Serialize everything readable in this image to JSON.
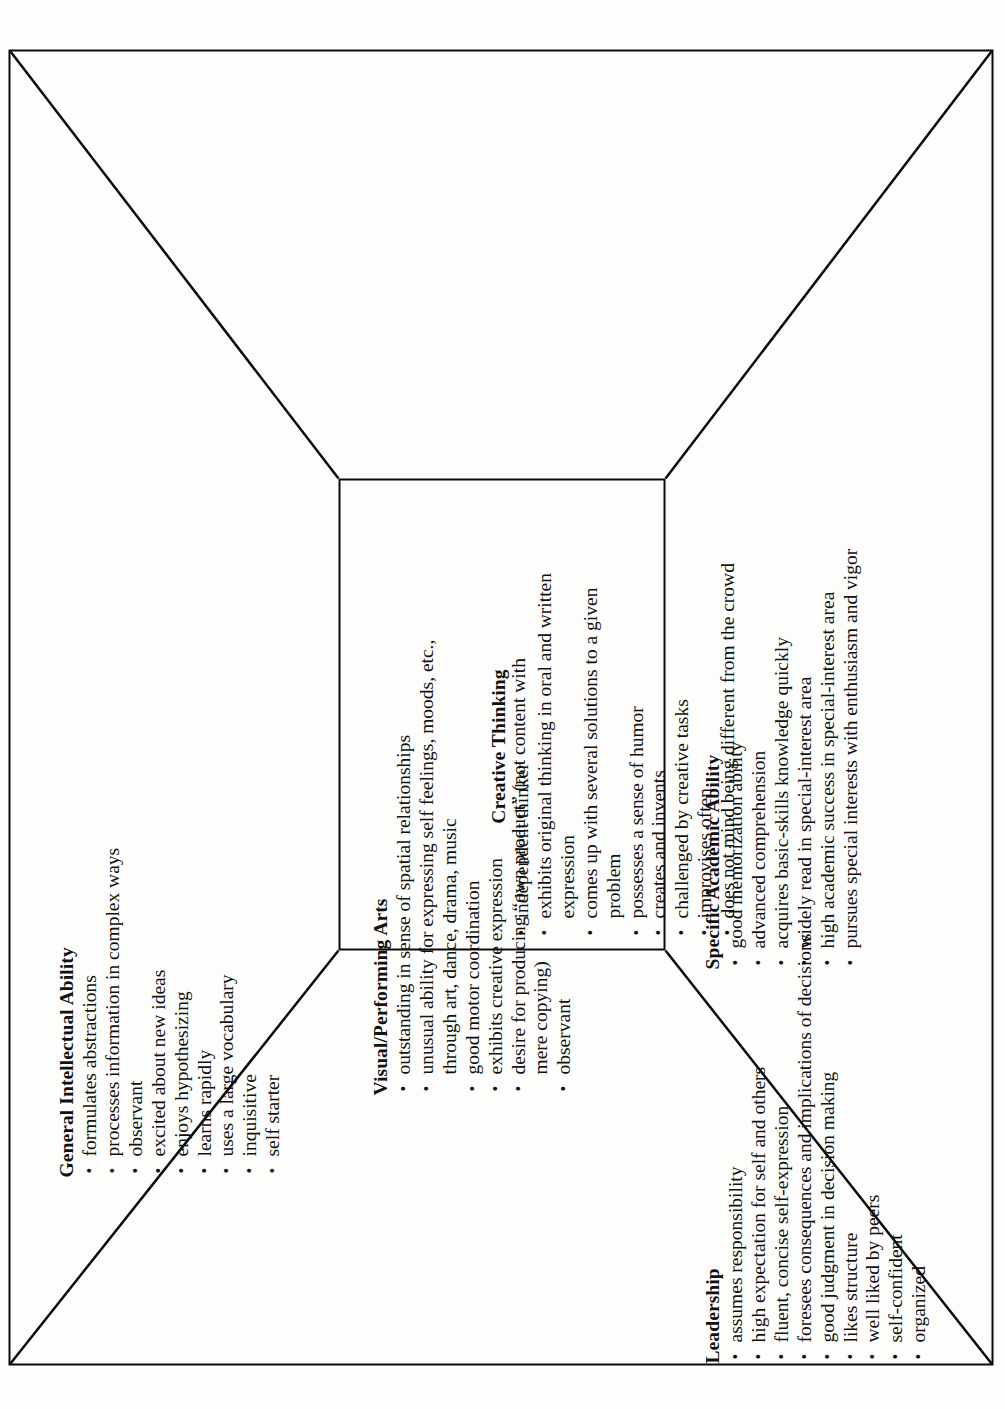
{
  "diagram": {
    "type": "perspective-box-diagram",
    "orientation": "rotated-90-ccw",
    "background_color": "#fdfdfb",
    "line_color": "#0a0a0a",
    "sections": [
      {
        "id": "general-intellectual-ability",
        "title": "General Intellectual Ability",
        "items": [
          "formulates abstractions",
          "processes information in complex ways",
          "observant",
          "excited about new ideas",
          "enjoys hypothesizing",
          "learns rapidly",
          "uses a large vocabulary",
          "inquisitive",
          "self starter"
        ]
      },
      {
        "id": "visual-performing-arts",
        "title": "Visual/Performing Arts",
        "items": [
          "outstanding in sense of spatial relationships",
          "unusual ability for expressing self feelings, moods, etc., through art, dance, drama, music",
          "good motor coordination",
          "exhibits creative expression",
          "desire for producing “own product” (not content with mere copying)",
          "observant"
        ]
      },
      {
        "id": "creative-thinking",
        "title": "Creative Thinking",
        "items": [
          "independent thinker",
          "exhibits original thinking in oral and written expression",
          "comes up with several solutions to a given problem",
          "possesses a sense of humor",
          "creates and invents",
          "challenged by creative tasks",
          "improvises often",
          "does not mind being different from the crowd"
        ]
      },
      {
        "id": "specific-academic-ability",
        "title": "Specific Academic Ability",
        "items": [
          "good memorization ability",
          "advanced comprehension",
          "acquires basic-skills knowledge quickly",
          "widely read in special-interest area",
          "high academic success in special-interest area",
          "pursues special interests with enthusiasm and vigor"
        ]
      },
      {
        "id": "leadership",
        "title": "Leadership",
        "items": [
          "assumes responsibility",
          "high expectation for self and others",
          "fluent, concise self-expression",
          "foresees consequences and implications of decisions",
          "good judgment in decision making",
          "likes structure",
          "well liked by peers",
          "self-confident",
          "organized"
        ]
      }
    ],
    "bullet_glyph": "•"
  }
}
